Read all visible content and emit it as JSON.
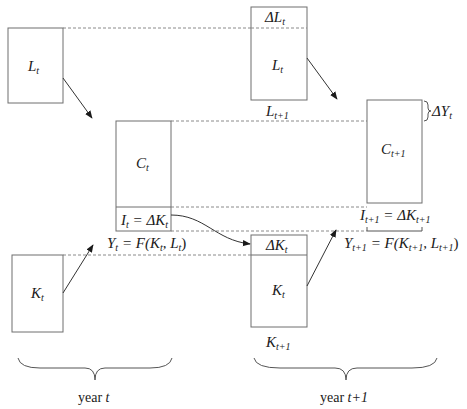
{
  "diagram": {
    "colors": {
      "line": "#6e6e6e",
      "dash": "#8a8a8a",
      "arrow": "#333333",
      "text": "#1a1a1a",
      "background": "#ffffff"
    },
    "year_t": {
      "labor_box": {
        "symbol": "L",
        "sub": "t"
      },
      "consumption_box": {
        "symbol": "C",
        "sub": "t"
      },
      "investment_label": {
        "lhs": "I",
        "lhs_sub": "t",
        "eq": " = ΔK",
        "rhs_sub": "t"
      },
      "output_equation": {
        "y": "Y",
        "y_sub": "t",
        "mid": " = F(K",
        "k_sub": "t",
        "comma": ", L",
        "l_sub": "t",
        "close": ")"
      },
      "capital_box": {
        "symbol": "K",
        "sub": "t"
      },
      "brace_label": {
        "text": "year ",
        "var": "t"
      }
    },
    "year_t1": {
      "labor_box": {
        "delta_label": {
          "symbol": "ΔL",
          "sub": "t"
        },
        "inner_label": {
          "symbol": "L",
          "sub": "t"
        },
        "below_label": {
          "symbol": "L",
          "sub": "t+1"
        }
      },
      "consumption_box": {
        "symbol": "C",
        "sub": "t+1"
      },
      "delta_output": {
        "symbol": "ΔY",
        "sub": "t"
      },
      "investment_label": {
        "lhs": "I",
        "lhs_sub": "t+1",
        "eq": " = ΔK",
        "rhs_sub": "t+1"
      },
      "output_equation": {
        "y": "Y",
        "y_sub": "t+1",
        "mid": " = F(K",
        "k_sub": "t+1",
        "comma": ", L",
        "l_sub": "t+1",
        "close": ")"
      },
      "capital_box": {
        "delta_label": {
          "symbol": "ΔK",
          "sub": "t"
        },
        "inner_label": {
          "symbol": "K",
          "sub": "t"
        },
        "below_label": {
          "symbol": "K",
          "sub": "t+1"
        }
      },
      "brace_label": {
        "text": "year ",
        "var": "t+1"
      }
    }
  }
}
